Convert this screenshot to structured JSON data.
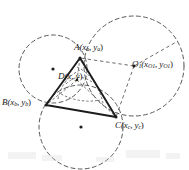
{
  "figure": {
    "stroke_color": "#2a2a2a",
    "dash_color": "#555555",
    "background": "#ffffff"
  },
  "labels": {
    "A": {
      "name": "A",
      "coords": "(x",
      "sub1": "a",
      "mid": ", y",
      "sub2": "a",
      "close": ")"
    },
    "B": {
      "name": "B",
      "coords": "(x",
      "sub1": "b",
      "mid": ", y",
      "sub2": "b",
      "close": ")"
    },
    "C": {
      "name": "C",
      "coords": "(x",
      "sub1": "c",
      "mid": ", y",
      "sub2": "c",
      "close": ")"
    },
    "D": {
      "name": "D",
      "coords": "(x",
      "mid": ", y",
      "close": ")"
    },
    "O1": {
      "name": "O",
      "sub0": "1",
      "coords": "(x",
      "sub1": "O1",
      "mid": ", y",
      "sub2": "O1",
      "close": ")"
    }
  },
  "geometry": {
    "triangle": {
      "A": [
        80,
        58
      ],
      "B": [
        46,
        105
      ],
      "C": [
        116,
        117
      ]
    },
    "point_D": [
      77,
      80
    ],
    "point_O1": [
      134,
      66
    ],
    "circles": [
      {
        "id": "circle-left",
        "cx": 53,
        "cy": 69,
        "r": 34,
        "center_dot": true
      },
      {
        "id": "circle-right",
        "cx": 134,
        "cy": 66,
        "r": 50,
        "center_dot": false
      },
      {
        "id": "circle-bottom",
        "cx": 81,
        "cy": 127,
        "r": 42,
        "center_dot": true
      }
    ],
    "small_arcs_center": [
      77,
      80
    ]
  }
}
